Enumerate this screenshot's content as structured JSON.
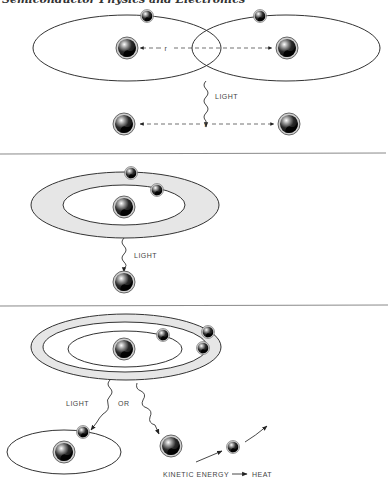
{
  "header": {
    "running_title": "Semiconductor Physics and Electronics"
  },
  "colors": {
    "line": "#333333",
    "ring_fill": "#e6e6e6",
    "divider": "#8a8a8a",
    "ball_dark": "#111111",
    "ball_rim": "#888888"
  },
  "panels": [
    {
      "id": "two-atoms",
      "labels": {
        "separation_top": "r",
        "separation_bottom": "r",
        "emission": "LIGHT"
      }
    },
    {
      "id": "excited-atom",
      "labels": {
        "emission": "LIGHT"
      }
    },
    {
      "id": "multi-level-atom",
      "labels": {
        "emission": "LIGHT",
        "alternative": "OR",
        "kinetic": "KINETIC ENERGY",
        "heat": "HEAT"
      }
    }
  ]
}
